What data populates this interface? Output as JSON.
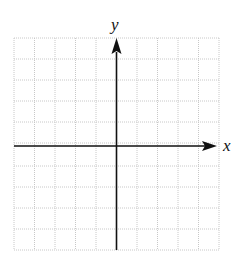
{
  "diagram": {
    "type": "coordinate-plane",
    "x_axis_label": "x",
    "y_axis_label": "y",
    "grid": {
      "columns": 10,
      "rows": 11,
      "cell_size_px": 20.5,
      "line_color": "#c8c8c8",
      "line_style": "dotted"
    },
    "axis_color": "#111111"
  }
}
